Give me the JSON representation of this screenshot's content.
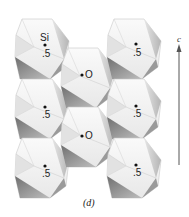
{
  "figure": {
    "caption": "(d)",
    "axis": {
      "label": "c",
      "direction": "up"
    },
    "atom_label": "Si",
    "octahedra": [
      {
        "column": "left",
        "row": 1,
        "height_label": ".5",
        "shows_atom_label": true
      },
      {
        "column": "left",
        "row": 2,
        "height_label": ".5"
      },
      {
        "column": "left",
        "row": 3,
        "height_label": ".5"
      },
      {
        "column": "middle",
        "row": 1,
        "height_label": "O"
      },
      {
        "column": "middle",
        "row": 2,
        "height_label": "O"
      },
      {
        "column": "right",
        "row": 1,
        "height_label": ".5"
      },
      {
        "column": "right",
        "row": 2,
        "height_label": ".5"
      },
      {
        "column": "right",
        "row": 3,
        "height_label": ".5"
      }
    ],
    "colors": {
      "face_light": "#f4f4f4",
      "face_mid": "#d9d9d9",
      "face_dark": "#8f8f8f",
      "edge": "#bdbdbd",
      "text": "#222222",
      "axis": "#555555"
    }
  }
}
